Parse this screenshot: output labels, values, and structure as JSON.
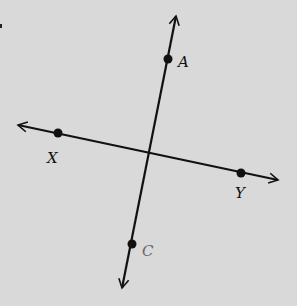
{
  "diagram": {
    "type": "intersecting-lines",
    "background": "#d9d9d9",
    "stroke": "#111111",
    "lines": [
      {
        "name": "line-AC",
        "from": [
          122,
          288
        ],
        "to": [
          176,
          16
        ],
        "arrows": "both"
      },
      {
        "name": "line-XY",
        "from": [
          18,
          125
        ],
        "to": [
          278,
          180
        ],
        "arrows": "both"
      }
    ],
    "points": [
      {
        "label": "A",
        "x": 168,
        "y": 59,
        "label_x": 178,
        "label_y": 67
      },
      {
        "label": "X",
        "x": 58,
        "y": 133,
        "label_x": 47,
        "label_y": 163
      },
      {
        "label": "Y",
        "x": 241,
        "y": 173,
        "label_x": 235,
        "label_y": 198
      },
      {
        "label": "C",
        "x": 132,
        "y": 244,
        "label_x": 142,
        "label_y": 256
      }
    ],
    "intersection": [
      148,
      154
    ]
  }
}
